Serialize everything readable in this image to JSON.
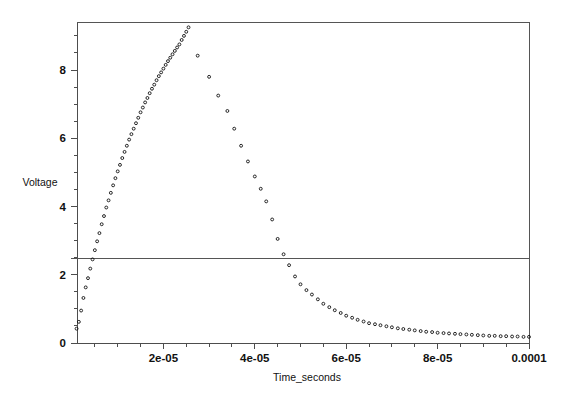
{
  "chart_data": {
    "type": "scatter",
    "title": "",
    "xlabel": "Time_seconds",
    "ylabel": "Voltage",
    "xlim": [
      0,
      0.0001
    ],
    "ylim": [
      0,
      9.45
    ],
    "grid": false,
    "legend": null,
    "legend_position": "none",
    "marker": "open-circle",
    "marker_color": "#111111",
    "xticks": [
      2e-05,
      4e-05,
      6e-05,
      8e-05,
      0.0001
    ],
    "xtick_labels": [
      "2e-05",
      "4e-05",
      "6e-05",
      "8e-05",
      "0.0001"
    ],
    "x_minor_tick_step": 5e-06,
    "yticks": [
      0,
      2,
      4,
      6,
      8
    ],
    "ytick_labels": [
      "0",
      "2",
      "4",
      "6",
      "8"
    ],
    "y_minor_tick_step": 0.5,
    "annotations": [
      {
        "kind": "horizontal-line",
        "name": "threshold-line",
        "value": 2.5,
        "label": ""
      }
    ],
    "series": [
      {
        "name": "Voltage",
        "x": [
          1e-06,
          1.5e-06,
          2e-06,
          2.5e-06,
          3e-06,
          3.5e-06,
          4e-06,
          4.5e-06,
          5e-06,
          5.5e-06,
          6e-06,
          6.5e-06,
          7e-06,
          7.5e-06,
          8e-06,
          8.5e-06,
          9e-06,
          9.5e-06,
          1e-05,
          1.05e-05,
          1.1e-05,
          1.15e-05,
          1.2e-05,
          1.25e-05,
          1.3e-05,
          1.35e-05,
          1.4e-05,
          1.45e-05,
          1.5e-05,
          1.55e-05,
          1.6e-05,
          1.65e-05,
          1.7e-05,
          1.75e-05,
          1.8e-05,
          1.85e-05,
          1.9e-05,
          1.95e-05,
          2e-05,
          2.05e-05,
          2.1e-05,
          2.15e-05,
          2.2e-05,
          2.25e-05,
          2.3e-05,
          2.35e-05,
          2.4e-05,
          2.45e-05,
          2.5e-05,
          2.55e-05,
          2.75e-05,
          3e-05,
          3.2e-05,
          3.4e-05,
          3.55e-05,
          3.7e-05,
          3.85e-05,
          4e-05,
          4.13e-05,
          4.25e-05,
          4.38e-05,
          4.5e-05,
          4.63e-05,
          4.75e-05,
          4.88e-05,
          5e-05,
          5.13e-05,
          5.25e-05,
          5.38e-05,
          5.5e-05,
          5.63e-05,
          5.75e-05,
          5.88e-05,
          6e-05,
          6.13e-05,
          6.25e-05,
          6.38e-05,
          6.5e-05,
          6.63e-05,
          6.75e-05,
          6.88e-05,
          7e-05,
          7.13e-05,
          7.25e-05,
          7.38e-05,
          7.5e-05,
          7.63e-05,
          7.75e-05,
          7.88e-05,
          8e-05,
          8.13e-05,
          8.25e-05,
          8.38e-05,
          8.5e-05,
          8.63e-05,
          8.75e-05,
          8.88e-05,
          9e-05,
          9.13e-05,
          9.25e-05,
          9.38e-05,
          9.5e-05,
          9.63e-05,
          9.75e-05,
          9.88e-05,
          0.0001
        ],
        "y": [
          0.42,
          0.62,
          0.95,
          1.32,
          1.63,
          1.9,
          2.18,
          2.45,
          2.72,
          2.98,
          3.22,
          3.48,
          3.72,
          3.97,
          4.18,
          4.4,
          4.62,
          4.83,
          5.03,
          5.22,
          5.42,
          5.6,
          5.78,
          5.96,
          6.12,
          6.28,
          6.44,
          6.6,
          6.76,
          6.9,
          7.05,
          7.18,
          7.32,
          7.45,
          7.57,
          7.7,
          7.82,
          7.93,
          8.04,
          8.15,
          8.26,
          8.36,
          8.46,
          8.56,
          8.66,
          8.75,
          8.88,
          9.0,
          9.12,
          9.25,
          8.42,
          7.8,
          7.25,
          6.8,
          6.28,
          5.78,
          5.32,
          4.88,
          4.52,
          4.15,
          3.62,
          3.05,
          2.6,
          2.28,
          1.95,
          1.72,
          1.55,
          1.42,
          1.28,
          1.15,
          1.05,
          0.96,
          0.88,
          0.8,
          0.74,
          0.68,
          0.63,
          0.58,
          0.55,
          0.52,
          0.49,
          0.46,
          0.43,
          0.41,
          0.39,
          0.37,
          0.35,
          0.33,
          0.32,
          0.3,
          0.29,
          0.28,
          0.27,
          0.26,
          0.25,
          0.24,
          0.23,
          0.22,
          0.21,
          0.21,
          0.2,
          0.2,
          0.19,
          0.19,
          0.18,
          0.18
        ]
      }
    ]
  }
}
